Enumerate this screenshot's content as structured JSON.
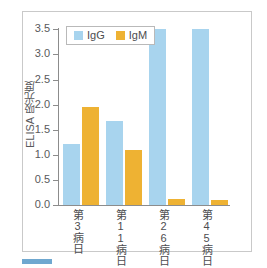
{
  "chart_data": {
    "type": "bar",
    "title": "",
    "xlabel": "",
    "ylabel": "ELISA 吸光度",
    "ylim": [
      0.0,
      3.5
    ],
    "ytick_labels": [
      "3.5",
      "3.0",
      "2.5",
      "2.0",
      "1.5",
      "1.0",
      "0.5",
      "0.0"
    ],
    "ytick_values": [
      3.5,
      3.0,
      2.5,
      2.0,
      1.5,
      1.0,
      0.5,
      0.0
    ],
    "grid": false,
    "legend_position": "top-left",
    "categories": [
      "第3病日",
      "第11病日",
      "第26病日",
      "第45病日"
    ],
    "series": [
      {
        "name": "IgG",
        "color": "#a8d4ee",
        "values": [
          1.21,
          1.68,
          3.5,
          3.5
        ]
      },
      {
        "name": "IgM",
        "color": "#eeb233",
        "values": [
          1.95,
          1.1,
          0.12,
          0.09
        ]
      }
    ]
  },
  "legend": {
    "items": [
      {
        "label": "IgG"
      },
      {
        "label": "IgM"
      }
    ]
  },
  "axes": {
    "y_title": "ELISA 吸光度",
    "ticks": [
      {
        "label": "3.5"
      },
      {
        "label": "3.0"
      },
      {
        "label": "2.5"
      },
      {
        "label": "2.0"
      },
      {
        "label": "1.5"
      },
      {
        "label": "1.0"
      },
      {
        "label": "0.5"
      },
      {
        "label": "0.0"
      }
    ]
  },
  "categories": [
    {
      "label": "第3病日"
    },
    {
      "label": "第11病日"
    },
    {
      "label": "第26病日"
    },
    {
      "label": "第45病日"
    }
  ]
}
